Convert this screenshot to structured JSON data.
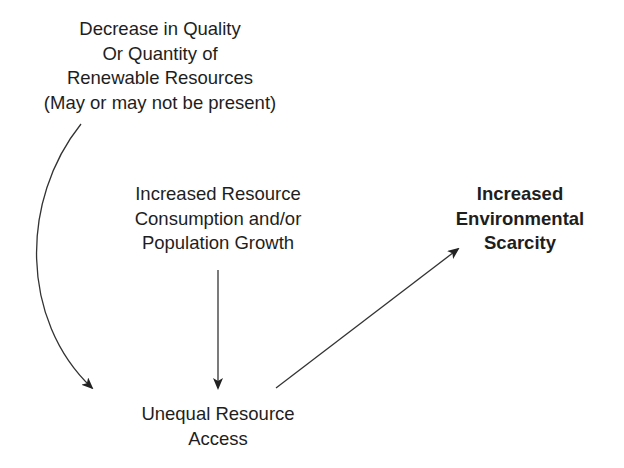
{
  "diagram": {
    "nodes": {
      "decrease": {
        "lines": [
          "Decrease in Quality",
          "Or Quantity of",
          "Renewable Resources",
          "(May or may not be present)"
        ]
      },
      "consumption": {
        "lines": [
          "Increased Resource",
          "Consumption and/or",
          "Population Growth"
        ]
      },
      "scarcity": {
        "lines": [
          "Increased",
          "Environmental",
          "Scarcity"
        ],
        "emphasis": "bold"
      },
      "unequal": {
        "lines": [
          "Unequal Resource",
          "Access"
        ]
      }
    },
    "edges": [
      {
        "from": "decrease",
        "to": "unequal",
        "style": "curved-arrow"
      },
      {
        "from": "consumption",
        "to": "unequal",
        "style": "straight-arrow"
      },
      {
        "from": "unequal",
        "to": "scarcity",
        "style": "straight-arrow"
      }
    ],
    "colors": {
      "text": "#1e1e1e",
      "arrow": "#333333",
      "background": "#ffffff"
    }
  }
}
